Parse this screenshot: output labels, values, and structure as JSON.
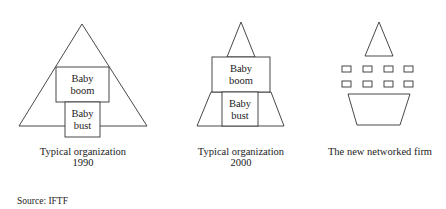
{
  "figures": [
    {
      "id": "org-1990",
      "caption_line1": "Typical organization",
      "caption_line2": "1990",
      "boxes": [
        {
          "line1": "Baby",
          "line2": "boom"
        },
        {
          "line1": "Baby",
          "line2": "bust"
        }
      ]
    },
    {
      "id": "org-2000",
      "caption_line1": "Typical organization",
      "caption_line2": "2000",
      "boxes": [
        {
          "line1": "Baby",
          "line2": "boom"
        },
        {
          "line1": "Baby",
          "line2": "bust"
        }
      ]
    },
    {
      "id": "networked-firm",
      "caption_line1": "The new networked firm",
      "caption_line2": ""
    }
  ],
  "source": "Source: IFTF",
  "colors": {
    "stroke": "#333333",
    "text": "#222222",
    "background": "#ffffff"
  }
}
